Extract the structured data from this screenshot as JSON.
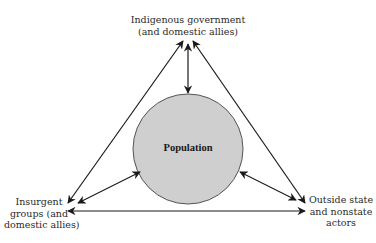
{
  "diagram": {
    "center": {
      "label": "Population",
      "fill": "#cfcfcf",
      "stroke": "#555555"
    },
    "nodes": {
      "top": {
        "lines": [
          "Indigenous government",
          "(and domestic allies)"
        ]
      },
      "left": {
        "lines": [
          "Insurgent",
          "groups (and",
          "domestic allies)"
        ]
      },
      "right": {
        "lines": [
          "Outside state",
          "and nonstate",
          "actors"
        ]
      }
    },
    "edges": [
      {
        "from": "top",
        "to": "left",
        "bidirectional": true
      },
      {
        "from": "top",
        "to": "right",
        "bidirectional": true
      },
      {
        "from": "left",
        "to": "right",
        "bidirectional": true
      },
      {
        "from": "top",
        "to": "center",
        "bidirectional": true
      },
      {
        "from": "left",
        "to": "center",
        "bidirectional": true
      },
      {
        "from": "right",
        "to": "center",
        "bidirectional": true
      }
    ],
    "colors": {
      "line": "#1a1a1a",
      "background": "#ffffff"
    }
  }
}
